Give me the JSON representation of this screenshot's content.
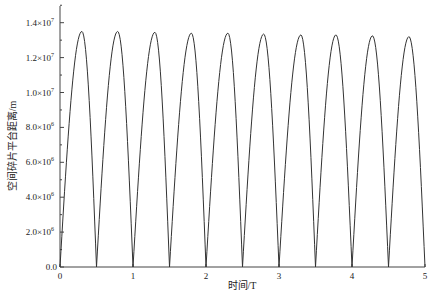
{
  "chart_data": {
    "type": "line",
    "title": "",
    "xlabel": "时间/T",
    "ylabel": "空间碎片平台距离/m",
    "xlim": [
      0,
      5
    ],
    "ylim": [
      0,
      15000000.0
    ],
    "grid": false,
    "legend": null,
    "x_ticks": [
      0,
      1,
      2,
      3,
      4,
      5
    ],
    "x_tick_labels": [
      "0",
      "1",
      "2",
      "3",
      "4",
      "5"
    ],
    "y_ticks": [
      0,
      2000000,
      4000000,
      6000000,
      8000000,
      10000000,
      12000000,
      14000000
    ],
    "y_tick_labels": [
      {
        "mant": "0.0",
        "exp": ""
      },
      {
        "mant": "2.0×10",
        "exp": "6"
      },
      {
        "mant": "4.0×10",
        "exp": "6"
      },
      {
        "mant": "6.0×10",
        "exp": "6"
      },
      {
        "mant": "8.0×10",
        "exp": "6"
      },
      {
        "mant": "1.0×10",
        "exp": "7"
      },
      {
        "mant": "1.2×10",
        "exp": "7"
      },
      {
        "mant": "1.4×10",
        "exp": "7"
      }
    ],
    "series": [
      {
        "name": "distance",
        "color": "#333333",
        "description": "Periodic arches; zeros every 0.5T, peaks slightly decaying",
        "zeros": [
          0,
          0.5,
          1.0,
          1.5,
          2.0,
          2.5,
          3.0,
          3.5,
          4.0,
          4.5,
          5.0
        ],
        "peaks_t": [
          0.3,
          0.79,
          1.3,
          1.8,
          2.3,
          2.79,
          3.3,
          3.78,
          4.28,
          4.78
        ],
        "peaks_value": [
          13500000,
          13500000,
          13450000,
          13400000,
          13400000,
          13350000,
          13300000,
          13300000,
          13250000,
          13200000
        ]
      }
    ]
  }
}
